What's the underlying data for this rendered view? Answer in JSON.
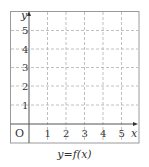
{
  "diagram": {
    "type": "coordinate-grid",
    "caption": "y=f(x)",
    "x_axis": {
      "label": "x",
      "ticks": [
        "1",
        "2",
        "3",
        "4",
        "5"
      ],
      "range": [
        -1,
        6
      ]
    },
    "y_axis": {
      "label": "y",
      "ticks": [
        "1",
        "2",
        "3",
        "4",
        "5"
      ],
      "range": [
        -1,
        6
      ]
    },
    "origin_label": "O",
    "grid": {
      "style": "dashed",
      "spacing": 1
    },
    "colors": {
      "grid": "#b0b0b0",
      "axis": "#555555",
      "border": "#9a9a9a",
      "text": "#333333"
    }
  }
}
